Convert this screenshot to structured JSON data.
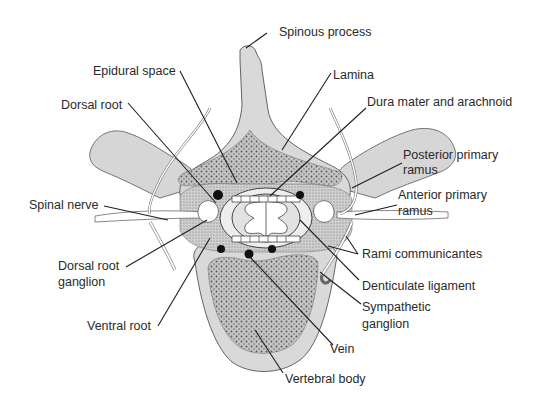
{
  "diagram": {
    "colors": {
      "bone": "#d9d9d9",
      "cancellous": "#b8b8b8",
      "outline": "#555555",
      "leader": "#1e1e1e",
      "nerve": "#ffffff",
      "text": "#2a2a2a"
    },
    "labels": [
      {
        "id": "spinous-process",
        "text": "Spinous process"
      },
      {
        "id": "epidural-space",
        "text": "Epidural space"
      },
      {
        "id": "lamina",
        "text": "Lamina"
      },
      {
        "id": "dorsal-root",
        "text": "Dorsal root"
      },
      {
        "id": "dura-mater",
        "text": "Dura mater and arachnoid"
      },
      {
        "id": "posterior-ramus-1",
        "text": "Posterior primary"
      },
      {
        "id": "posterior-ramus-2",
        "text": "ramus"
      },
      {
        "id": "anterior-ramus-1",
        "text": "Anterior primary"
      },
      {
        "id": "anterior-ramus-2",
        "text": "ramus"
      },
      {
        "id": "spinal-nerve",
        "text": "Spinal nerve"
      },
      {
        "id": "rami-communicantes",
        "text": "Rami communicantes"
      },
      {
        "id": "drg-1",
        "text": "Dorsal root"
      },
      {
        "id": "drg-2",
        "text": "ganglion"
      },
      {
        "id": "denticulate-ligament",
        "text": "Denticulate ligament"
      },
      {
        "id": "sympathetic-1",
        "text": "Sympathetic"
      },
      {
        "id": "sympathetic-2",
        "text": "ganglion"
      },
      {
        "id": "ventral-root",
        "text": "Ventral root"
      },
      {
        "id": "vein",
        "text": "Vein"
      },
      {
        "id": "vertebral-body",
        "text": "Vertebral body"
      }
    ]
  }
}
